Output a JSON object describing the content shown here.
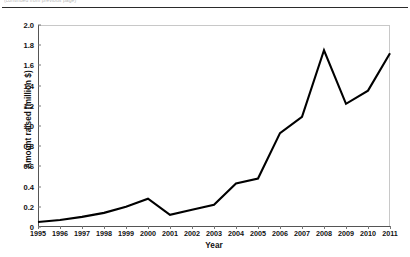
{
  "page": {
    "caption_fragment": "(continued from previous page)"
  },
  "chart_data": {
    "type": "line",
    "title": "",
    "xlabel": "Year",
    "ylabel": "Amount raised (million $)",
    "categories": [
      "1995",
      "1996",
      "1997",
      "1998",
      "1999",
      "2000",
      "2001",
      "2002",
      "2003",
      "2004",
      "2005",
      "2006",
      "2007",
      "2008",
      "2009",
      "2010",
      "2011"
    ],
    "values": [
      0.05,
      0.07,
      0.1,
      0.14,
      0.2,
      0.28,
      0.12,
      0.17,
      0.22,
      0.43,
      0.48,
      0.93,
      1.09,
      1.75,
      1.22,
      1.35,
      1.72
    ],
    "series": [
      {
        "name": "Amount raised",
        "values": [
          0.05,
          0.07,
          0.1,
          0.14,
          0.2,
          0.28,
          0.12,
          0.17,
          0.22,
          0.43,
          0.48,
          0.93,
          1.09,
          1.75,
          1.22,
          1.35,
          1.72
        ]
      }
    ],
    "ylim": [
      0,
      2.0
    ],
    "ytick_labels": [
      "0",
      "0.2",
      "0.4",
      "0.6",
      "0.8",
      "1.0",
      "1.2",
      "1.4",
      "1.6",
      "1.8",
      "2.0"
    ],
    "ytick_values": [
      0,
      0.2,
      0.4,
      0.6,
      0.8,
      1.0,
      1.2,
      1.4,
      1.6,
      1.8,
      2.0
    ],
    "grid": false,
    "legend": "none",
    "line_color": "#000000",
    "line_width": 2.1,
    "background_color": "#ffffff",
    "frame_color": "#c8c8c8"
  }
}
